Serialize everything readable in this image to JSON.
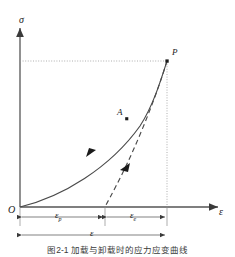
{
  "figure": {
    "caption": "图2-1  加载与卸载时的应力应变曲线",
    "axes": {
      "y_label": "σ",
      "x_label": "ε",
      "origin_label": "O"
    },
    "points": [
      {
        "id": "A",
        "label": "A",
        "x": 127,
        "y": 119
      },
      {
        "id": "P",
        "label": "P",
        "x": 167,
        "y": 61
      }
    ],
    "dimensions": [
      {
        "id": "plastic-strain",
        "label": "ε",
        "sub": "p"
      },
      {
        "id": "elastic-strain",
        "label": "ε",
        "sub": "e"
      },
      {
        "id": "total-strain",
        "label": "ε",
        "sub": ""
      }
    ],
    "curves": [
      {
        "id": "loading-curve",
        "style": "solid",
        "direction": "up-right",
        "from": "O",
        "to": "P"
      },
      {
        "id": "unloading-curve",
        "style": "dashed",
        "direction": "down-left",
        "from": "P",
        "to": "residual-strain-point"
      }
    ],
    "guides": [
      {
        "id": "horizontal-guide-to-P",
        "style": "dotted"
      },
      {
        "id": "vertical-guide-from-P",
        "style": "dotted"
      }
    ],
    "colors": {
      "ink": "#1a1a1a",
      "curve": "#4a4a4a",
      "axis": "#555555",
      "guide": "#9a9a9a",
      "background": "#ffffff"
    }
  }
}
